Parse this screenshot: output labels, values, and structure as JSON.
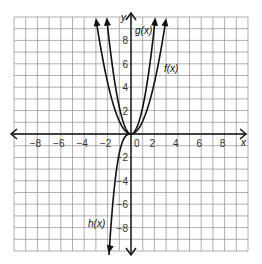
{
  "chart_data": {
    "type": "line",
    "title": "",
    "xlabel": "x",
    "ylabel": "y",
    "xlim": [
      -10,
      10
    ],
    "ylim": [
      -10,
      10
    ],
    "grid": true,
    "x_ticks": [
      -8,
      -6,
      -4,
      -2,
      0,
      2,
      4,
      6,
      8
    ],
    "y_ticks": [
      -8,
      -6,
      -4,
      -2,
      2,
      4,
      6,
      8
    ],
    "x_tick_labels": [
      "-8",
      "-6",
      "-4",
      "-2",
      "0",
      "2",
      "4",
      "6",
      "8"
    ],
    "y_tick_labels": [
      "-8",
      "-6",
      "-4",
      "-2",
      "2",
      "4",
      "6",
      "8"
    ],
    "series": [
      {
        "name": "f(x)",
        "label": "f(x)",
        "description": "upward parabola, widest",
        "points": [
          [
            -3,
            9.9
          ],
          [
            -2,
            4.4
          ],
          [
            -1,
            1.1
          ],
          [
            0,
            0
          ],
          [
            1,
            1.1
          ],
          [
            2,
            4.4
          ],
          [
            3,
            9.9
          ]
        ]
      },
      {
        "name": "g(x)",
        "label": "g(x)",
        "description": "upward parabola, narrower",
        "points": [
          [
            -2.1,
            10
          ],
          [
            -1,
            2.3
          ],
          [
            0,
            0
          ],
          [
            1,
            2.3
          ],
          [
            2.1,
            10
          ]
        ]
      },
      {
        "name": "h(x)",
        "label": "h(x)",
        "description": "downward-opening curve from origin to lower left",
        "points": [
          [
            0,
            0
          ],
          [
            -0.5,
            -0.5
          ],
          [
            -1,
            -2.5
          ],
          [
            -1.5,
            -6
          ],
          [
            -1.9,
            -10
          ]
        ]
      }
    ],
    "curve_labels": [
      {
        "text": "g(x)",
        "x": 0.3,
        "y": 8.3
      },
      {
        "text": "f(x)",
        "x": 3.0,
        "y": 5.3
      },
      {
        "text": "h(x)",
        "x": -2.4,
        "y": -7.7
      }
    ],
    "legend": "none"
  },
  "labels": {
    "x_axis": "x",
    "y_axis": "y",
    "g": "g(x)",
    "f": "f(x)",
    "h": "h(x)"
  }
}
